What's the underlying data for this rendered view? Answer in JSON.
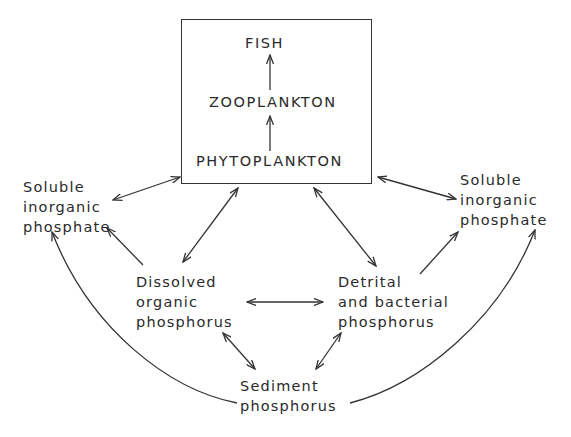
{
  "diagram": {
    "food_chain_box": {
      "items": [
        "FISH",
        "ZOOPLANKTON",
        "PHYTOPLANKTON"
      ]
    },
    "nodes": {
      "soluble_left": {
        "lines": [
          "Soluble",
          "inorganic",
          "phosphate"
        ]
      },
      "soluble_right": {
        "lines": [
          "Soluble",
          "inorganic",
          "phosphate"
        ]
      },
      "dissolved_organic": {
        "lines": [
          "Dissolved",
          "organic",
          "phosphorus"
        ]
      },
      "detrital": {
        "lines": [
          "Detrital",
          "and bacterial",
          "phosphorus"
        ]
      },
      "sediment": {
        "lines": [
          "Sediment",
          "phosphorus"
        ]
      }
    },
    "edges": [
      {
        "from": "PHYTOPLANKTON",
        "to": "ZOOPLANKTON",
        "type": "one-way"
      },
      {
        "from": "ZOOPLANKTON",
        "to": "FISH",
        "type": "one-way"
      },
      {
        "from": "food_chain_box",
        "to": "soluble_left",
        "type": "two-way"
      },
      {
        "from": "food_chain_box",
        "to": "soluble_right",
        "type": "two-way"
      },
      {
        "from": "food_chain_box",
        "to": "dissolved_organic",
        "type": "two-way"
      },
      {
        "from": "food_chain_box",
        "to": "detrital",
        "type": "two-way"
      },
      {
        "from": "dissolved_organic",
        "to": "soluble_left",
        "type": "one-way"
      },
      {
        "from": "detrital",
        "to": "soluble_right",
        "type": "one-way"
      },
      {
        "from": "dissolved_organic",
        "to": "detrital",
        "type": "two-way"
      },
      {
        "from": "dissolved_organic",
        "to": "sediment",
        "type": "two-way"
      },
      {
        "from": "detrital",
        "to": "sediment",
        "type": "two-way"
      },
      {
        "from": "sediment",
        "to": "soluble_left",
        "type": "one-way"
      },
      {
        "from": "sediment",
        "to": "soluble_right",
        "type": "one-way"
      }
    ],
    "line_color": "#333333"
  }
}
